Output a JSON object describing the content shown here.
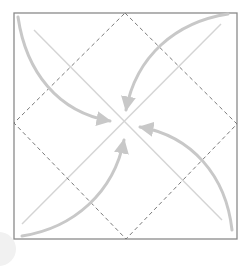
{
  "diagram": {
    "title": "",
    "colors": {
      "background": "#ffffff",
      "square_border": "#8a8a8a",
      "dashed_diamond": "#7a7a7a",
      "crease_lines": "#d4d4d4",
      "arrows": "#c8c8c8"
    },
    "square": {
      "x": 14,
      "y": 13,
      "width": 223,
      "height": 226
    },
    "diamond": {
      "points": [
        [
          125,
          13
        ],
        [
          237,
          124
        ],
        [
          126,
          239
        ],
        [
          14,
          123
        ]
      ],
      "style": "dashed"
    },
    "crease_lines": [
      {
        "from": [
          34,
          30
        ],
        "to": [
          222,
          220
        ]
      },
      {
        "from": [
          221,
          24
        ],
        "to": [
          22,
          224
        ]
      }
    ],
    "arrows": [
      {
        "name": "top-left-to-center",
        "path": "M18,17 C26,72 58,112 106,120",
        "head_tip": [
          119,
          122
        ]
      },
      {
        "name": "top-right-to-center",
        "path": "M228,14 C176,22 136,56 127,104",
        "head_tip": [
          125,
          118
        ]
      },
      {
        "name": "bottom-right-to-center",
        "path": "M232,230 C226,176 192,136 144,128",
        "head_tip": [
          131,
          124
        ]
      },
      {
        "name": "bottom-left-to-center",
        "path": "M22,236 C74,228 114,192 123,146",
        "head_tip": [
          124,
          131
        ]
      }
    ]
  }
}
